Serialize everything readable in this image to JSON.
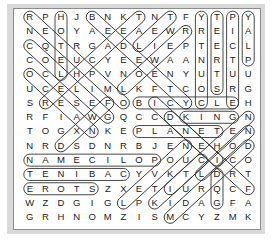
{
  "puzzle": {
    "type": "word-search",
    "columns": 15,
    "rows_count": 15,
    "rows": [
      "RPHJBNKTNTFYTPY",
      "NEOYAEEAEWRREIA",
      "CQTRGADLIEPTECL",
      "COEUCYEEWAANRTP",
      "OCLHPVNOENYUTUU",
      "UCELIMLKFTCOSRG",
      "SRESEFOBICYCLEH",
      "RFIAWGQCCDKINGN",
      "TOGXNKEPLANETEN",
      "NRDSDNRBJENEHOD",
      "NAMECILOPOUCICO",
      "TENIBACYVKTLDRT",
      "EROTSZXETIURQCF",
      "WZDGIGLPKIDAGFA",
      "GRHNOMZISMCYZMK"
    ],
    "found_words": [
      {
        "word": "HOTEL",
        "from": [
          2,
          0
        ],
        "to": [
          2,
          4
        ]
      },
      {
        "word": "COUNTRY",
        "from": [
          11,
          6
        ],
        "to": [
          11,
          0
        ]
      },
      {
        "word": "STREET",
        "from": [
          12,
          5
        ],
        "to": [
          12,
          0
        ]
      },
      {
        "word": "PICTURE",
        "from": [
          13,
          0
        ],
        "to": [
          13,
          6
        ]
      },
      {
        "word": "PLAY",
        "from": [
          14,
          3
        ],
        "to": [
          14,
          0
        ]
      },
      {
        "word": "BICYCLE",
        "from": [
          7,
          6
        ],
        "to": [
          13,
          6
        ]
      },
      {
        "word": "KING",
        "from": [
          10,
          7
        ],
        "to": [
          13,
          7
        ]
      },
      {
        "word": "PLANET",
        "from": [
          7,
          8
        ],
        "to": [
          12,
          8
        ]
      },
      {
        "word": "POLICEMAN",
        "from": [
          8,
          10
        ],
        "to": [
          0,
          10
        ]
      },
      {
        "word": "CABINET",
        "from": [
          6,
          11
        ],
        "to": [
          0,
          11
        ]
      },
      {
        "word": "STORE",
        "from": [
          4,
          12
        ],
        "to": [
          0,
          12
        ]
      },
      {
        "word": "DOG",
        "from": [
          12,
          11
        ],
        "to": [
          12,
          13
        ]
      },
      {
        "word": "RECYCLE",
        "from": [
          0,
          0
        ],
        "to": [
          6,
          6
        ]
      },
      {
        "word": "BEDROOM",
        "from": [
          4,
          0
        ],
        "to": [
          10,
          6
        ]
      },
      {
        "word": "TEACHER",
        "from": [
          7,
          0
        ],
        "to": [
          1,
          6
        ]
      },
      {
        "word": "TEA",
        "from": [
          9,
          0
        ],
        "to": [
          7,
          2
        ]
      },
      {
        "word": "READY",
        "from": [
          10,
          1
        ],
        "to": [
          6,
          5
        ]
      },
      {
        "word": "CHEESE",
        "from": [
          0,
          2
        ],
        "to": [
          5,
          7
        ]
      },
      {
        "word": "OCEAN",
        "from": [
          0,
          4
        ],
        "to": [
          4,
          8
        ]
      },
      {
        "word": "FISH",
        "from": [
          5,
          6
        ],
        "to": [
          2,
          9
        ]
      },
      {
        "word": "NEEDLE",
        "from": [
          14,
          7
        ],
        "to": [
          9,
          12
        ]
      },
      {
        "word": "NECK",
        "from": [
          14,
          8
        ],
        "to": [
          11,
          11
        ]
      },
      {
        "word": "DOCTOR",
        "from": [
          14,
          9
        ],
        "to": [
          9,
          14
        ]
      },
      {
        "word": "DUCK",
        "from": [
          9,
          7
        ],
        "to": [
          12,
          10
        ]
      },
      {
        "word": "FICTION",
        "from": [
          14,
          12
        ],
        "to": [
          8,
          6
        ]
      },
      {
        "word": "KITE",
        "from": [
          8,
          13
        ],
        "to": [
          11,
          10
        ]
      },
      {
        "word": "LIGHT",
        "from": [
          6,
          13
        ],
        "to": [
          10,
          9
        ]
      }
    ]
  }
}
